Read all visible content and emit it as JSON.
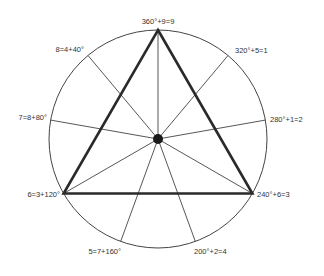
{
  "diagram": {
    "type": "enneagram-circle",
    "center": {
      "x": 158,
      "y": 139
    },
    "radius": 109,
    "colors": {
      "line": "#444444",
      "triangle": "#2a2a2a",
      "dot": "#1a1a1a",
      "text": "#333333"
    },
    "points": [
      {
        "angle_deg": 360,
        "label": "360°+9=9",
        "x": 158,
        "y": 30
      },
      {
        "angle_deg": 320,
        "label": "320°+5=1",
        "x": 228,
        "y": 55.5
      },
      {
        "angle_deg": 280,
        "label": "280°+1=2",
        "x": 265.3,
        "y": 120.1
      },
      {
        "angle_deg": 240,
        "label": "240°+6=3",
        "x": 252.4,
        "y": 193.5
      },
      {
        "angle_deg": 200,
        "label": "200°+2=4",
        "x": 195.3,
        "y": 241.4
      },
      {
        "angle_deg": 160,
        "label": "5=7+160°",
        "x": 120.7,
        "y": 241.4
      },
      {
        "angle_deg": 120,
        "label": "6=3+120°",
        "x": 63.6,
        "y": 193.5
      },
      {
        "angle_deg": 80,
        "label": "7=8+80°",
        "x": 50.7,
        "y": 120.1
      },
      {
        "angle_deg": 40,
        "label": "8=4+40°",
        "x": 88,
        "y": 55.5
      }
    ],
    "triangle_vertices": [
      "360°",
      "240°",
      "120°"
    ]
  }
}
